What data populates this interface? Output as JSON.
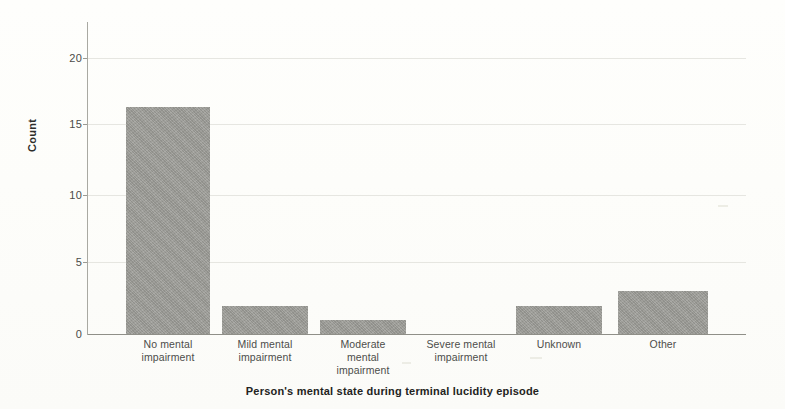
{
  "chart_data": {
    "type": "bar",
    "title": "",
    "subtitle": "",
    "xlabel": "Person's mental state during terminal lucidity episode",
    "ylabel": "Count",
    "categories": [
      "No mental impairment",
      "Mild mental impairment",
      "Moderate mental impairment",
      "Severe mental impairment",
      "Unknown",
      "Other"
    ],
    "category_lines": [
      [
        "No mental",
        "impairment"
      ],
      [
        "Mild mental",
        "impairment"
      ],
      [
        "Moderate",
        "mental",
        "impairment"
      ],
      [
        "Severe mental",
        "impairment"
      ],
      [
        "Unknown"
      ],
      [
        "Other"
      ]
    ],
    "values": [
      16,
      2,
      1,
      0,
      2,
      3
    ],
    "ylim": [
      0,
      22
    ],
    "yticks": [
      0,
      5,
      10,
      15,
      20
    ],
    "ytick_labels": [
      "0",
      "5",
      "10",
      "15",
      "20"
    ],
    "grid": true,
    "grid_axis": "y",
    "legend": false,
    "bar_color": "#9b9b96",
    "grid_color": "#e2e2dc",
    "axis_color": "#8f8f88",
    "background_color": "#fdfdfb"
  },
  "axes": {
    "y_title": "Count",
    "x_title": "Person's mental state during terminal lucidity episode",
    "ytick_0": "0",
    "ytick_5": "5",
    "ytick_10": "10",
    "ytick_15": "15",
    "ytick_20": "20"
  },
  "xlabels": {
    "c0_l0": "No mental",
    "c0_l1": "impairment",
    "c1_l0": "Mild mental",
    "c1_l1": "impairment",
    "c2_l0": "Moderate",
    "c2_l1": "mental",
    "c2_l2": "impairment",
    "c3_l0": "Severe mental",
    "c3_l1": "impairment",
    "c4_l0": "Unknown",
    "c5_l0": "Other"
  }
}
